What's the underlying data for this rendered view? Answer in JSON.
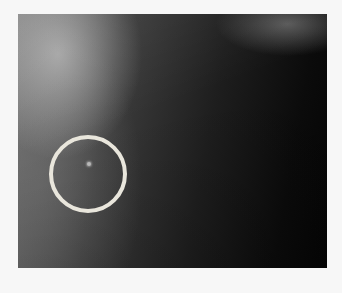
{
  "image": {
    "description": "Dark grayscale photograph with a bright diffuse glow at upper-left and a circled faint bright spot",
    "background_color": "#f7f7f7",
    "annotation": {
      "shape": "circle",
      "color": "#e9e6dc"
    }
  }
}
